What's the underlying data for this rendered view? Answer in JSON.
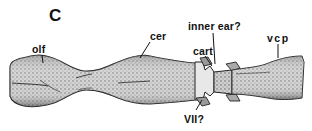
{
  "figure": {
    "panel_letter": "C",
    "labels": {
      "olf": "olf",
      "cer": "cer",
      "inner_ear": "inner ear?",
      "cart": "cart",
      "vcp": "vcp",
      "vii": "VII?"
    },
    "colors": {
      "ink": "#111111",
      "stipple_dark": "#555555",
      "stipple_light": "#bbbbbb",
      "background": "#ffffff"
    }
  }
}
